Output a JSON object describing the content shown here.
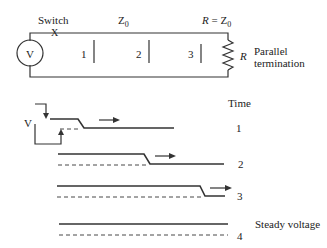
{
  "circuit": {
    "switch_label": "Switch",
    "switch_mark": "X",
    "source_label": "V",
    "line_impedance": "Z",
    "line_impedance_sub": "0",
    "termination_eq_r": "R",
    "termination_eq": " = Z",
    "termination_eq_sub": "0",
    "resistor_label": "R",
    "termination_label_1": "Parallel",
    "termination_label_2": "termination",
    "positions": [
      "1",
      "2",
      "3"
    ]
  },
  "waveforms": {
    "time_label": "Time",
    "amplitude_label": "V",
    "rows": [
      {
        "index": "1",
        "step_x": 48,
        "note": ""
      },
      {
        "index": "2",
        "step_x": 148,
        "note": ""
      },
      {
        "index": "3",
        "step_x": 202,
        "note": ""
      },
      {
        "index": "4",
        "step_x": null,
        "note": "Steady voltage"
      }
    ]
  }
}
